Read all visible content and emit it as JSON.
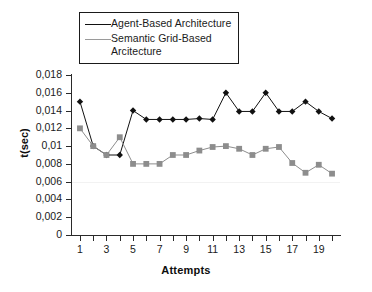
{
  "chart_data": {
    "type": "line",
    "title": "",
    "xlabel": "Attempts",
    "ylabel": "t(sec)",
    "x": [
      1,
      2,
      3,
      4,
      5,
      6,
      7,
      8,
      9,
      10,
      11,
      12,
      13,
      14,
      15,
      16,
      17,
      18,
      19,
      20
    ],
    "xlim": [
      0.4,
      20.6
    ],
    "ylim": [
      0,
      0.018
    ],
    "x_tick_labels": [
      "1",
      "3",
      "5",
      "7",
      "9",
      "11",
      "13",
      "15",
      "17",
      "19"
    ],
    "x_tick_values": [
      1,
      3,
      5,
      7,
      9,
      11,
      13,
      15,
      17,
      19
    ],
    "y_tick_labels": [
      "0",
      "0,002",
      "0,004",
      "0,006",
      "0,008",
      "0,01",
      "0,012",
      "0,014",
      "0,016",
      "0,018"
    ],
    "y_tick_values": [
      0,
      0.002,
      0.004,
      0.006,
      0.008,
      0.01,
      0.012,
      0.014,
      0.016,
      0.018
    ],
    "grid": false,
    "legend_position": "top-center",
    "series": [
      {
        "name": "Agent-Based Architecture",
        "color": "#111111",
        "marker": "diamond",
        "values": [
          0.015,
          0.01,
          0.009,
          0.009,
          0.014,
          0.013,
          0.013,
          0.013,
          0.013,
          0.0131,
          0.013,
          0.016,
          0.0139,
          0.0139,
          0.016,
          0.0139,
          0.0139,
          0.015,
          0.0139,
          0.0131
        ]
      },
      {
        "name": "Semantic Grid-Based Arcitecture",
        "color": "#8d8d8d",
        "marker": "square",
        "values": [
          0.012,
          0.01,
          0.009,
          0.011,
          0.008,
          0.008,
          0.008,
          0.009,
          0.009,
          0.0095,
          0.0099,
          0.01,
          0.0097,
          0.009,
          0.0097,
          0.0099,
          0.0081,
          0.007,
          0.0079,
          0.0069
        ]
      }
    ]
  },
  "legend": {
    "entries": [
      {
        "label": "Agent-Based Architecture"
      },
      {
        "label": "Semantic Grid-Based\nArcitecture"
      }
    ]
  }
}
